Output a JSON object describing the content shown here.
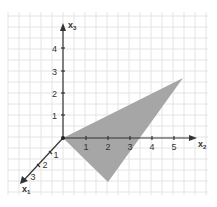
{
  "diagram": {
    "type": "3d-coordinate-system",
    "colors": {
      "background": "#ffffff",
      "grid": "#e2e2e2",
      "axis": "#333333",
      "triangle_fill": "#a6a6a6",
      "label": "#333333"
    },
    "axes": {
      "x1": {
        "label": "x",
        "subscript": "1",
        "ticks": [
          "1",
          "2",
          "3"
        ]
      },
      "x2": {
        "label": "x",
        "subscript": "2",
        "ticks": [
          "1",
          "2",
          "3",
          "4",
          "5"
        ]
      },
      "x3": {
        "label": "x",
        "subscript": "3",
        "ticks": [
          "1",
          "2",
          "3",
          "4"
        ]
      }
    },
    "shape": {
      "kind": "triangle",
      "vertices_px": [
        [
          63,
          138
        ],
        [
          183,
          78
        ],
        [
          108,
          182
        ]
      ]
    }
  }
}
